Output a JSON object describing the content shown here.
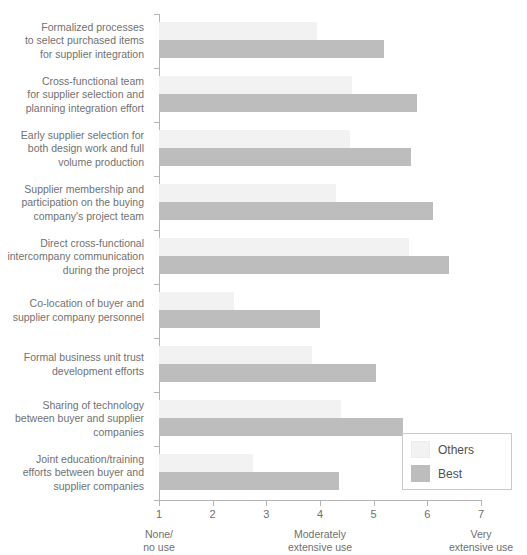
{
  "chart_data": {
    "type": "bar",
    "orientation": "horizontal",
    "title": "",
    "xlabel": "",
    "ylabel": "",
    "xlim": [
      1,
      7
    ],
    "grid": false,
    "legend_position": "bottom-right",
    "ticks": [
      "1",
      "2",
      "3",
      "4",
      "5",
      "6",
      "7"
    ],
    "anchors": [
      {
        "at": 1,
        "line1": "None/",
        "line2": "no use"
      },
      {
        "at": 4,
        "line1": "Moderately",
        "line2": "extensive use"
      },
      {
        "at": 7,
        "line1": "Very",
        "line2": "extensive use"
      }
    ],
    "categories": [
      "Formalized processes\nto select purchased items\nfor supplier integration",
      "Cross-functional team\nfor supplier selection and\nplanning integration effort",
      "Early supplier selection for\nboth design work and full\nvolume production",
      "Supplier membership and\nparticipation on the buying\ncompany's project team",
      "Direct cross-functional\nintercompany communication\nduring the project",
      "Co-location of buyer and\nsupplier company personnel",
      "Formal business unit trust\ndevelopment efforts",
      "Sharing of technology\nbetween buyer and supplier\ncompanies",
      "Joint education/training\nefforts between buyer and\nsupplier companies"
    ],
    "series": [
      {
        "name": "Others",
        "color": "#f2f2f2",
        "values": [
          3.95,
          4.6,
          4.55,
          4.3,
          5.65,
          2.4,
          3.85,
          4.4,
          2.75
        ]
      },
      {
        "name": "Best",
        "color": "#bdbdbd",
        "values": [
          5.2,
          5.8,
          5.7,
          6.1,
          6.4,
          4.0,
          5.05,
          5.55,
          4.35
        ]
      }
    ]
  },
  "legend": {
    "items": [
      {
        "label": "Others"
      },
      {
        "label": "Best"
      }
    ]
  }
}
